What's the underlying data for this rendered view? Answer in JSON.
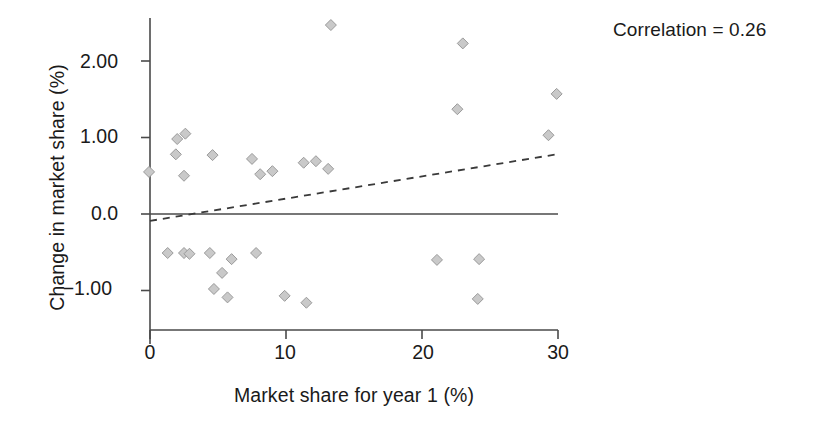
{
  "chart_data": {
    "type": "scatter",
    "title": "",
    "xlabel": "Market share for year 1 (%)",
    "ylabel": "Change in market share (%)",
    "xlim": [
      0,
      30
    ],
    "ylim": [
      -1.35,
      2.65
    ],
    "grid": false,
    "legend": null,
    "xticks": [
      0,
      10,
      20,
      30
    ],
    "xticklabels": [
      "0",
      "10",
      "20",
      "30"
    ],
    "yticks": [
      2.0,
      1.0,
      0.0,
      -1.0
    ],
    "yticklabels": [
      "2.00",
      "1.00",
      "0.0",
      "−1.00"
    ],
    "annotations": [
      {
        "text": "Correlation = 0.26",
        "value": 0.26,
        "label": "Correlation"
      }
    ],
    "reference_line": {
      "type": "horizontal",
      "y": 0.0,
      "style": "solid"
    },
    "trend_line": {
      "type": "linear-fit",
      "style": "dashed",
      "x_start": 0.0,
      "y_start": -0.09,
      "x_end": 29.9,
      "y_end": 0.78
    },
    "marker": {
      "shape": "diamond",
      "fill": "#c9c9c9",
      "edge": "#9a9a9a",
      "size": 11
    },
    "points": [
      {
        "x": -0.07,
        "y": 0.55
      },
      {
        "x": 1.3,
        "y": -0.51
      },
      {
        "x": 1.9,
        "y": 0.78
      },
      {
        "x": 2.0,
        "y": 0.98
      },
      {
        "x": 2.5,
        "y": -0.51
      },
      {
        "x": 2.5,
        "y": 0.5
      },
      {
        "x": 2.6,
        "y": 1.05
      },
      {
        "x": 2.9,
        "y": -0.52
      },
      {
        "x": 4.4,
        "y": -0.51
      },
      {
        "x": 4.6,
        "y": 0.77
      },
      {
        "x": 4.7,
        "y": -0.98
      },
      {
        "x": 5.3,
        "y": -0.77
      },
      {
        "x": 5.7,
        "y": -1.09
      },
      {
        "x": 6.0,
        "y": -0.59
      },
      {
        "x": 7.5,
        "y": 0.72
      },
      {
        "x": 7.8,
        "y": -0.51
      },
      {
        "x": 8.1,
        "y": 0.52
      },
      {
        "x": 9.0,
        "y": 0.56
      },
      {
        "x": 9.9,
        "y": -1.07
      },
      {
        "x": 11.3,
        "y": 0.67
      },
      {
        "x": 11.5,
        "y": -1.16
      },
      {
        "x": 12.2,
        "y": 0.69
      },
      {
        "x": 13.1,
        "y": 0.59
      },
      {
        "x": 13.3,
        "y": 2.47
      },
      {
        "x": 21.1,
        "y": -0.6
      },
      {
        "x": 22.6,
        "y": 1.37
      },
      {
        "x": 23.0,
        "y": 2.23
      },
      {
        "x": 24.1,
        "y": -1.11
      },
      {
        "x": 24.2,
        "y": -0.59
      },
      {
        "x": 29.3,
        "y": 1.03
      },
      {
        "x": 29.9,
        "y": 1.57
      }
    ]
  },
  "figure": {
    "annotation": "Correlation = 0.26",
    "x_axis_title": "Market share for year 1 (%)",
    "y_axis_title": "Change in market share (%)",
    "axis_color": "#444444",
    "text_color": "#1a1a1a",
    "background": "#ffffff"
  }
}
